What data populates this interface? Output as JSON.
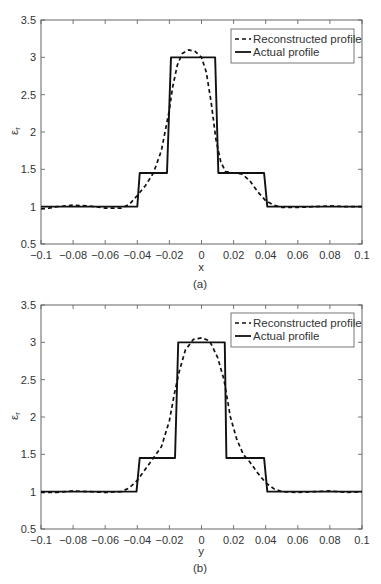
{
  "figure": {
    "panels": [
      {
        "panel_label": "(a)",
        "xlabel": "x",
        "ylabel_main": "ε",
        "ylabel_sub": "r",
        "legend": [
          "Reconstructed profile",
          "Actual profile"
        ]
      },
      {
        "panel_label": "(b)",
        "xlabel": "y",
        "ylabel_main": "ε",
        "ylabel_sub": "r",
        "legend": [
          "Reconstructed profile",
          "Actual profile"
        ]
      }
    ]
  },
  "chart_data": [
    {
      "type": "line",
      "title": "",
      "panel_label": "(a)",
      "xlabel": "x",
      "ylabel": "ε_r",
      "xlim": [
        -0.1,
        0.1
      ],
      "ylim": [
        0.5,
        3.5
      ],
      "grid": false,
      "xticks": [
        -0.1,
        -0.08,
        -0.06,
        -0.04,
        -0.02,
        0,
        0.02,
        0.04,
        0.06,
        0.08,
        0.1
      ],
      "xtick_labels": [
        "−0.1",
        "−0.08",
        "−0.06",
        "−0.04",
        "−0.02",
        "0",
        "0.02",
        "0.04",
        "0.06",
        "0.08",
        "0.1"
      ],
      "yticks": [
        0.5,
        1,
        1.5,
        2,
        2.5,
        3,
        3.5
      ],
      "ytick_labels": [
        "0.5",
        "1",
        "1.5",
        "2",
        "2.5",
        "3",
        "3.5"
      ],
      "legend": {
        "position": "upper right",
        "entries": [
          "Reconstructed profile",
          "Actual profile"
        ]
      },
      "series": [
        {
          "name": "Reconstructed profile",
          "style": "dashed",
          "color": "#111111",
          "x": [
            -0.1,
            -0.095,
            -0.09,
            -0.08,
            -0.07,
            -0.06,
            -0.05,
            -0.045,
            -0.04,
            -0.035,
            -0.03,
            -0.025,
            -0.02,
            -0.018,
            -0.015,
            -0.012,
            -0.008,
            -0.004,
            0.0,
            0.003,
            0.006,
            0.009,
            0.012,
            0.015,
            0.02,
            0.025,
            0.03,
            0.035,
            0.04,
            0.045,
            0.05,
            0.06,
            0.07,
            0.08,
            0.09,
            0.1
          ],
          "y": [
            0.97,
            0.98,
            1.0,
            1.02,
            1.01,
            0.98,
            0.98,
            1.03,
            1.15,
            1.28,
            1.45,
            1.75,
            2.3,
            2.6,
            2.9,
            3.05,
            3.1,
            3.08,
            3.0,
            2.8,
            2.4,
            1.9,
            1.6,
            1.47,
            1.45,
            1.44,
            1.35,
            1.2,
            1.08,
            1.02,
            0.99,
            0.99,
            1.0,
            1.01,
            1.0,
            1.0
          ]
        },
        {
          "name": "Actual profile",
          "style": "solid",
          "color": "#111111",
          "x": [
            -0.1,
            -0.04,
            -0.0385,
            -0.0215,
            -0.019,
            0.0085,
            0.0105,
            0.039,
            0.041,
            0.1
          ],
          "y": [
            1.0,
            1.0,
            1.45,
            1.45,
            3.0,
            3.0,
            1.45,
            1.45,
            1.0,
            1.0
          ]
        }
      ]
    },
    {
      "type": "line",
      "title": "",
      "panel_label": "(b)",
      "xlabel": "y",
      "ylabel": "ε_r",
      "xlim": [
        -0.1,
        0.1
      ],
      "ylim": [
        0.5,
        3.5
      ],
      "grid": false,
      "xticks": [
        -0.1,
        -0.08,
        -0.06,
        -0.04,
        -0.02,
        0,
        0.02,
        0.04,
        0.06,
        0.08,
        0.1
      ],
      "xtick_labels": [
        "−0.1",
        "−0.08",
        "−0.06",
        "−0.04",
        "−0.02",
        "0",
        "0.02",
        "0.04",
        "0.06",
        "0.08",
        "0.1"
      ],
      "yticks": [
        0.5,
        1,
        1.5,
        2,
        2.5,
        3,
        3.5
      ],
      "ytick_labels": [
        "0.5",
        "1",
        "1.5",
        "2",
        "2.5",
        "3",
        "3.5"
      ],
      "legend": {
        "position": "upper right",
        "entries": [
          "Reconstructed profile",
          "Actual profile"
        ]
      },
      "series": [
        {
          "name": "Reconstructed profile",
          "style": "dashed",
          "color": "#111111",
          "x": [
            -0.1,
            -0.09,
            -0.08,
            -0.07,
            -0.06,
            -0.05,
            -0.045,
            -0.04,
            -0.035,
            -0.03,
            -0.025,
            -0.02,
            -0.017,
            -0.014,
            -0.01,
            -0.005,
            0.0,
            0.005,
            0.01,
            0.014,
            0.018,
            0.022,
            0.026,
            0.03,
            0.035,
            0.04,
            0.045,
            0.05,
            0.06,
            0.07,
            0.08,
            0.09,
            0.1
          ],
          "y": [
            0.99,
            0.99,
            1.01,
            1.0,
            0.99,
            1.0,
            1.05,
            1.15,
            1.3,
            1.45,
            1.6,
            1.95,
            2.3,
            2.6,
            2.9,
            3.04,
            3.06,
            3.02,
            2.8,
            2.5,
            2.0,
            1.7,
            1.5,
            1.4,
            1.25,
            1.12,
            1.04,
            1.0,
            0.99,
            1.0,
            1.01,
            0.99,
            1.0
          ]
        },
        {
          "name": "Actual profile",
          "style": "solid",
          "color": "#111111",
          "x": [
            -0.1,
            -0.0405,
            -0.0385,
            -0.0165,
            -0.0145,
            0.0145,
            0.0155,
            0.039,
            0.041,
            0.1
          ],
          "y": [
            1.0,
            1.0,
            1.45,
            1.45,
            3.0,
            3.0,
            1.45,
            1.45,
            1.0,
            1.0
          ]
        }
      ]
    }
  ]
}
